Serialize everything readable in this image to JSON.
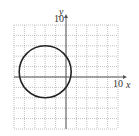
{
  "chart_data": {
    "type": "scatter",
    "title": "",
    "xlabel": "x",
    "ylabel": "y",
    "xlim": [
      -10,
      10
    ],
    "ylim": [
      -10,
      10
    ],
    "grid": true,
    "grid_step": 2,
    "tick_labels": {
      "x_max": "10",
      "y_max": "10"
    },
    "series": [
      {
        "name": "circle",
        "shape": "circle",
        "center": [
          -4,
          1
        ],
        "radius": 5
      }
    ],
    "legend": null
  },
  "labels": {
    "x_axis": "x",
    "y_axis": "y",
    "x_tick": "10",
    "y_tick": "10"
  },
  "colors": {
    "grid": "#9a9a9a",
    "axis": "#555555",
    "curve": "#222222"
  }
}
